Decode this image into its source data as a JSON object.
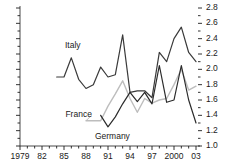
{
  "chart_data": {
    "type": "line",
    "title": "",
    "subtitle": "",
    "xlabel": "",
    "ylabel": "",
    "xlim": [
      1979,
      2003
    ],
    "ylim": [
      1.0,
      2.8
    ],
    "grid": false,
    "legend_position": "inline-labels",
    "y_axis_side": "right",
    "y_ticks": [
      1.0,
      1.2,
      1.4,
      1.6,
      1.8,
      2.0,
      2.2,
      2.4,
      2.6,
      2.8
    ],
    "y_tick_labels": [
      "1.0",
      "1.2",
      "1.4",
      "1.6",
      "1.8",
      "2.0",
      "2.2",
      "2.4",
      "2.6",
      "2.8"
    ],
    "y_minor_step": 0.1,
    "x_ticks": [
      1979,
      1982,
      1985,
      1988,
      1991,
      1994,
      1997,
      2000,
      2003
    ],
    "x_tick_labels": [
      "1979",
      "82",
      "85",
      "88",
      "91",
      "94",
      "97",
      "2000",
      "03"
    ],
    "x_minor_step": 1,
    "series": [
      {
        "name": "Italy",
        "color": "#3a3a3a",
        "width": 1.2,
        "label_x": 1986.2,
        "label_y": 2.3,
        "x": [
          1984,
          1985,
          1986,
          1987,
          1988,
          1989,
          1990,
          1991,
          1992,
          1993,
          1994,
          1995,
          1996,
          1997,
          1998,
          1999,
          2000,
          2001,
          2002,
          2003
        ],
        "values": [
          1.9,
          1.9,
          2.15,
          1.87,
          1.75,
          1.8,
          2.03,
          1.9,
          1.93,
          2.45,
          1.7,
          1.72,
          1.72,
          1.63,
          2.22,
          2.1,
          2.4,
          2.55,
          2.22,
          2.1
        ]
      },
      {
        "name": "France",
        "color": "#bdbdbd",
        "width": 1.4,
        "label_x": 1987.0,
        "label_y": 1.4,
        "x": [
          1988,
          1989,
          1990,
          1991,
          1992,
          1993,
          1994,
          1995,
          1996,
          1997,
          1998,
          1999,
          2000,
          2001,
          2002,
          2003
        ],
        "values": [
          1.33,
          1.33,
          1.33,
          1.52,
          1.68,
          1.85,
          1.62,
          1.44,
          1.62,
          1.56,
          1.6,
          1.62,
          1.8,
          2.0,
          1.73,
          1.78
        ]
      },
      {
        "name": "Germany",
        "color": "#2b2b2b",
        "width": 1.2,
        "label_x": 1991.6,
        "label_y": 1.12,
        "x": [
          1990,
          1991,
          1992,
          1993,
          1994,
          1995,
          1996,
          1997,
          1998,
          1999,
          2000,
          2001,
          2002,
          2003
        ],
        "values": [
          1.4,
          1.25,
          1.38,
          1.55,
          1.7,
          1.58,
          1.7,
          1.55,
          2.05,
          1.57,
          1.6,
          2.05,
          1.6,
          1.3
        ]
      }
    ]
  }
}
